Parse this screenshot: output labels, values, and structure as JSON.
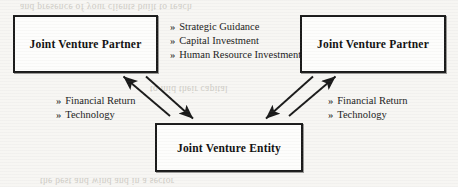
{
  "diagram": {
    "background_color": "#f7f6f3",
    "line_color": "#1a1a1a",
    "text_color": "#111111",
    "bullet_glyph": "»",
    "nodes": {
      "partner_left": {
        "label": "Joint Venture Partner"
      },
      "partner_right": {
        "label": "Joint Venture Partner"
      },
      "entity": {
        "label": "Joint Venture Entity"
      }
    },
    "labels": {
      "center": {
        "items": [
          "Strategic Guidance",
          "Capital Investment",
          "Human Resource Investment"
        ]
      },
      "left": {
        "items": [
          "Financial Return",
          "Technology"
        ]
      },
      "right": {
        "items": [
          "Financial Return",
          "Technology"
        ]
      }
    },
    "ghost_text": {
      "line_top": "and presence of your clients built to reach",
      "line_mid": "to mid their capital",
      "line_bottom": "the best and wind and in a sector"
    }
  }
}
